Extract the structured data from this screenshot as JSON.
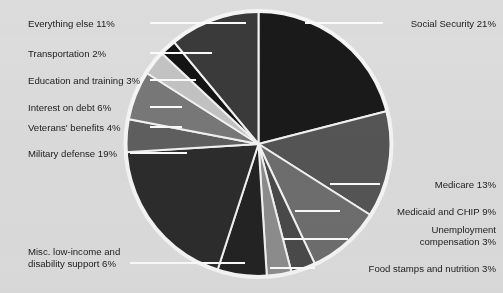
{
  "chart_data": {
    "type": "pie",
    "title": "",
    "subtitle": "",
    "xlabel": "",
    "ylabel": "",
    "legend_position": "callout-labels",
    "grid": false,
    "units": "percent",
    "start_angle_deg": -90,
    "direction": "clockwise",
    "categories": [
      "Social Security",
      "Medicare",
      "Medicaid and CHIP",
      "Unemployment compensation",
      "Food stamps and nutrition",
      "Misc. low-income and disability support",
      "Military defense",
      "Veterans' benefits",
      "Interest on debt",
      "Education and training",
      "Transportation",
      "Everything else"
    ],
    "values": [
      21,
      13,
      9,
      3,
      3,
      6,
      19,
      4,
      6,
      3,
      2,
      11
    ],
    "colors": [
      "#1a1a1a",
      "#555555",
      "#6e6e6e",
      "#4a4a4a",
      "#8d8d8d",
      "#232323",
      "#2c2c2c",
      "#5f5f5f",
      "#787878",
      "#c3c3c3",
      "#141414",
      "#3a3a3a"
    ],
    "slice_separator_color": "#f2f2f2",
    "background_color": "#dcdcdc",
    "outline_color": "#f5f5f5"
  },
  "labels": [
    {
      "id": "everything-else",
      "text": "Everything else 11%",
      "percent": "11%"
    },
    {
      "id": "transportation",
      "text": "Transportation 2%",
      "percent": "2%"
    },
    {
      "id": "education-and-training",
      "text": "Education and training 3%",
      "percent": "3%"
    },
    {
      "id": "interest-on-debt",
      "text": "Interest on debt 6%",
      "percent": "6%"
    },
    {
      "id": "veterans-benefits",
      "text": "Veterans' benefits 4%",
      "percent": "4%"
    },
    {
      "id": "military-defense",
      "text": "Military defense 19%",
      "percent": "19%"
    },
    {
      "id": "misc-low-income-1",
      "text": "Misc. low-income and",
      "percent": ""
    },
    {
      "id": "misc-low-income-2",
      "text": "disability support 6%",
      "percent": "6%"
    },
    {
      "id": "social-security",
      "text": "Social Security 21%",
      "percent": "21%"
    },
    {
      "id": "medicare",
      "text": "Medicare 13%",
      "percent": "13%"
    },
    {
      "id": "medicaid-and-chip",
      "text": "Medicaid and CHIP 9%",
      "percent": "9%"
    },
    {
      "id": "unemployment-1",
      "text": "Unemployment",
      "percent": ""
    },
    {
      "id": "unemployment-2",
      "text": "compensation 3%",
      "percent": "3%"
    },
    {
      "id": "food-stamps",
      "text": "Food stamps and nutrition 3%",
      "percent": "3%"
    }
  ]
}
